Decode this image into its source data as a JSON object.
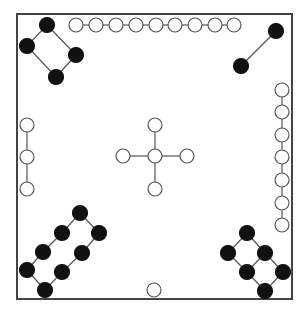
{
  "board": {
    "border": {
      "x": 17,
      "y": 14,
      "w": 275,
      "h": 285,
      "color": "#444444"
    },
    "line_color": "#555555",
    "black_fill": "#111111",
    "white_fill": "#ffffff",
    "stroke": "#555555"
  },
  "groups": [
    {
      "name": "top-left-black-diamond",
      "color": "black",
      "r": 7.5,
      "nodes": [
        [
          47,
          25
        ],
        [
          76,
          55
        ],
        [
          56,
          77
        ],
        [
          27,
          46
        ]
      ],
      "edges": [
        [
          0,
          1
        ],
        [
          1,
          2
        ],
        [
          2,
          3
        ],
        [
          3,
          0
        ]
      ]
    },
    {
      "name": "top-right-black-pair",
      "color": "black",
      "r": 7.5,
      "nodes": [
        [
          276,
          31
        ],
        [
          241,
          66
        ]
      ],
      "edges": [
        [
          0,
          1
        ]
      ]
    },
    {
      "name": "top-white-row",
      "color": "white",
      "r": 7,
      "nodes": [
        [
          76,
          25
        ],
        [
          96,
          25
        ],
        [
          116,
          25
        ],
        [
          136,
          25
        ],
        [
          156,
          25
        ],
        [
          175,
          25
        ],
        [
          195,
          25
        ],
        [
          215,
          25
        ],
        [
          234,
          25
        ]
      ],
      "edges": [
        [
          0,
          1
        ],
        [
          1,
          2
        ],
        [
          2,
          3
        ],
        [
          3,
          4
        ],
        [
          4,
          5
        ],
        [
          5,
          6
        ],
        [
          6,
          7
        ],
        [
          7,
          8
        ]
      ]
    },
    {
      "name": "right-white-column",
      "color": "white",
      "r": 7,
      "nodes": [
        [
          282,
          90
        ],
        [
          282,
          112
        ],
        [
          282,
          135
        ],
        [
          282,
          157
        ],
        [
          282,
          180
        ],
        [
          282,
          203
        ],
        [
          282,
          225
        ]
      ],
      "edges": [
        [
          0,
          1
        ],
        [
          1,
          2
        ],
        [
          2,
          3
        ],
        [
          3,
          4
        ],
        [
          4,
          5
        ],
        [
          5,
          6
        ]
      ]
    },
    {
      "name": "left-white-column",
      "color": "white",
      "r": 7,
      "nodes": [
        [
          27,
          125
        ],
        [
          27,
          157
        ],
        [
          27,
          189
        ]
      ],
      "edges": [
        [
          0,
          1
        ],
        [
          1,
          2
        ]
      ]
    },
    {
      "name": "center-white-cross",
      "color": "white",
      "r": 7,
      "nodes": [
        [
          155,
          156
        ],
        [
          155,
          125
        ],
        [
          123,
          156
        ],
        [
          187,
          156
        ],
        [
          155,
          189
        ]
      ],
      "edges": [
        [
          0,
          1
        ],
        [
          0,
          2
        ],
        [
          0,
          3
        ],
        [
          0,
          4
        ]
      ]
    },
    {
      "name": "bottom-left-black-ladder",
      "color": "black",
      "r": 7.5,
      "nodes": [
        [
          80,
          213
        ],
        [
          62,
          233
        ],
        [
          43,
          252
        ],
        [
          27,
          270
        ],
        [
          45,
          290
        ],
        [
          62,
          272
        ],
        [
          82,
          253
        ],
        [
          99,
          233
        ]
      ],
      "edges": [
        [
          0,
          1
        ],
        [
          1,
          2
        ],
        [
          2,
          3
        ],
        [
          3,
          4
        ],
        [
          4,
          5
        ],
        [
          5,
          6
        ],
        [
          6,
          7
        ],
        [
          7,
          0
        ]
      ]
    },
    {
      "name": "bottom-right-black-ladder",
      "color": "black",
      "r": 7.5,
      "nodes": [
        [
          247,
          233
        ],
        [
          228,
          253
        ],
        [
          265,
          253
        ],
        [
          247,
          272
        ],
        [
          283,
          272
        ],
        [
          265,
          291
        ]
      ],
      "edges": [
        [
          0,
          1
        ],
        [
          0,
          2
        ],
        [
          1,
          3
        ],
        [
          2,
          3
        ],
        [
          2,
          4
        ],
        [
          3,
          5
        ],
        [
          4,
          5
        ]
      ]
    },
    {
      "name": "bottom-center-white-single",
      "color": "white",
      "r": 7,
      "nodes": [
        [
          154,
          290
        ]
      ],
      "edges": []
    }
  ]
}
